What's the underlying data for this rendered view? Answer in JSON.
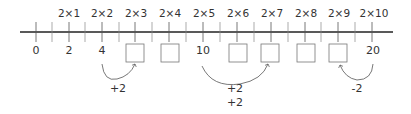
{
  "diagram": {
    "type": "number-line",
    "top_labels": [
      "2×1",
      "2×2",
      "2×3",
      "2×4",
      "2×5",
      "2×6",
      "2×7",
      "2×8",
      "2×9",
      "2×10"
    ],
    "bottom_values": [
      "0",
      "2",
      "4",
      "",
      "",
      "10",
      "",
      "",
      "",
      "20"
    ],
    "missing_boxes_count": 7,
    "jumps": [
      {
        "from": "4",
        "to": "2×3 box",
        "label": "+2"
      },
      {
        "from": "10",
        "to": "2×7 box",
        "label_line1": "+2",
        "label_line2": "+2"
      },
      {
        "from": "20",
        "to": "2×9 box",
        "label": "-2"
      }
    ]
  },
  "labels": {
    "t1": "2×1",
    "t2": "2×2",
    "t3": "2×3",
    "t4": "2×4",
    "t5": "2×5",
    "t6": "2×6",
    "t7": "2×7",
    "t8": "2×8",
    "t9": "2×9",
    "t10": "2×10",
    "v0": "0",
    "v2": "2",
    "v4": "4",
    "v10": "10",
    "v20": "20",
    "jump1": "+2",
    "jump2a": "+2",
    "jump2b": "+2",
    "jump3": "-2"
  }
}
